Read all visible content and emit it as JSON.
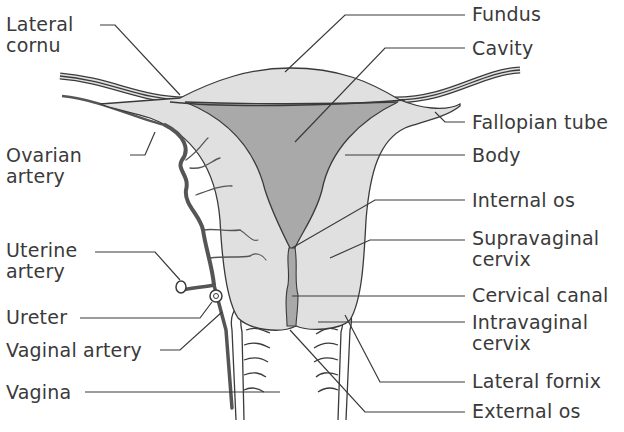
{
  "diagram": {
    "colors": {
      "tissue_fill": "#e0e0e0",
      "cavity_fill": "#a9a9a9",
      "outline": "#3a3a3a",
      "artery": "#555555",
      "text": "#3a3a3a",
      "background": "#ffffff"
    },
    "labels_left": [
      {
        "id": "lateral-cornu",
        "line1": "Lateral",
        "line2": "cornu"
      },
      {
        "id": "ovarian-artery",
        "line1": "Ovarian",
        "line2": "artery"
      },
      {
        "id": "uterine-artery",
        "line1": "Uterine",
        "line2": "artery"
      },
      {
        "id": "ureter",
        "line1": "Ureter"
      },
      {
        "id": "vaginal-artery",
        "line1": "Vaginal artery"
      },
      {
        "id": "vagina",
        "line1": "Vagina"
      }
    ],
    "labels_right": [
      {
        "id": "fundus",
        "line1": "Fundus"
      },
      {
        "id": "cavity",
        "line1": "Cavity"
      },
      {
        "id": "fallopian-tube",
        "line1": "Fallopian tube"
      },
      {
        "id": "body",
        "line1": "Body"
      },
      {
        "id": "internal-os",
        "line1": "Internal os"
      },
      {
        "id": "supravaginal-cervix",
        "line1": "Supravaginal",
        "line2": "cervix"
      },
      {
        "id": "cervical-canal",
        "line1": "Cervical canal"
      },
      {
        "id": "intravaginal-cervix",
        "line1": "Intravaginal",
        "line2": "cervix"
      },
      {
        "id": "lateral-fornix",
        "line1": "Lateral fornix"
      },
      {
        "id": "external-os",
        "line1": "External os"
      }
    ]
  }
}
